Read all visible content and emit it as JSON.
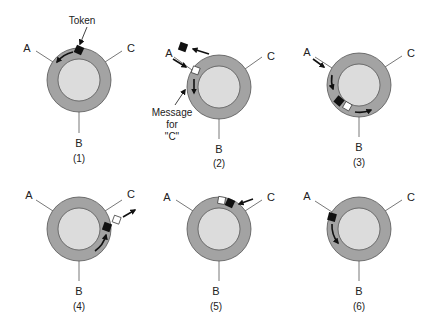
{
  "colors": {
    "ring": "#a3a3a3",
    "ring_stroke": "#555555",
    "inner": "#dcdcdc",
    "token": "#111111",
    "message": "#ffffff",
    "arrow": "#111111",
    "line": "#555555"
  },
  "annotations": {
    "token_label": "Token",
    "message_line1": "Message",
    "message_line2": "for",
    "message_line3": "\"C\""
  },
  "panels": [
    {
      "caption": "(1)",
      "station_a": "A",
      "station_b": "B",
      "station_c": "C"
    },
    {
      "caption": "(2)",
      "station_a": "A",
      "station_b": "B",
      "station_c": "C"
    },
    {
      "caption": "(3)",
      "station_a": "A",
      "station_b": "B",
      "station_c": "C"
    },
    {
      "caption": "(4)",
      "station_a": "A",
      "station_b": "B",
      "station_c": "C"
    },
    {
      "caption": "(5)",
      "station_a": "A",
      "station_b": "B",
      "station_c": "C"
    },
    {
      "caption": "(6)",
      "station_a": "A",
      "station_b": "B",
      "station_c": "C"
    }
  ]
}
